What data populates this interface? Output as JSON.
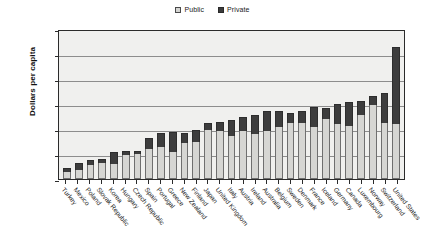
{
  "chart_data": {
    "type": "bar",
    "title": "",
    "subtitle": "",
    "xlabel": "",
    "ylabel": "Dollars per capita",
    "ylim": [
      0,
      6000
    ],
    "yticks": [
      0,
      1000,
      2000,
      3000,
      4000,
      5000,
      6000
    ],
    "grid": true,
    "stacked": true,
    "legend_position": "top-center",
    "legend": [
      "Public",
      "Private"
    ],
    "colors": {
      "public": "#d6d6d3",
      "private": "#3d3d3d",
      "plot_background": "#f0f0ee",
      "gridline": "#8d8d8d",
      "axis": "#2b2b2b"
    },
    "categories": [
      "Turkey",
      "Mexico",
      "Poland",
      "Slovak Republic",
      "Korea",
      "Hungary",
      "Czech Republic",
      "Spain",
      "Portugal",
      "Greece",
      "New Zealand",
      "Finland",
      "Japan",
      "United Kingdom",
      "Italy",
      "Austria",
      "Ireland",
      "Australia",
      "Belgium",
      "Sweden",
      "Denmark",
      "France",
      "Iceland",
      "Germany",
      "Canada",
      "Luxembourg",
      "Norway",
      "Switzerland",
      "United States"
    ],
    "series": [
      {
        "name": "Public",
        "values": [
          300,
          380,
          560,
          640,
          600,
          960,
          1020,
          1190,
          1270,
          1090,
          1430,
          1480,
          1960,
          1920,
          1740,
          1920,
          1820,
          1930,
          2080,
          2230,
          2230,
          2100,
          2420,
          2220,
          2130,
          2560,
          2980,
          2230,
          2200
        ]
      },
      {
        "name": "Private",
        "values": [
          160,
          260,
          190,
          160,
          500,
          160,
          120,
          460,
          590,
          800,
          430,
          470,
          300,
          350,
          620,
          580,
          760,
          800,
          640,
          430,
          490,
          800,
          430,
          800,
          950,
          560,
          360,
          1200,
          3080
        ]
      }
    ],
    "totals": [
      460,
      640,
      750,
      800,
      1100,
      1120,
      1140,
      1650,
      1860,
      1890,
      1860,
      1950,
      2260,
      2270,
      2360,
      2500,
      2580,
      2730,
      2720,
      2660,
      2720,
      2900,
      2850,
      3020,
      3080,
      3120,
      3340,
      3430,
      5280
    ]
  }
}
